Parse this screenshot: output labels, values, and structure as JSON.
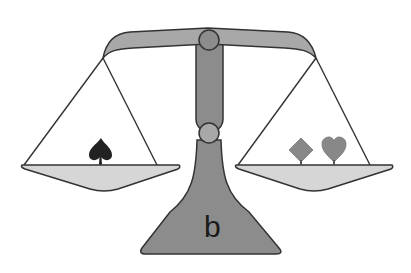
{
  "figure": {
    "base_label": "b",
    "left_pan": {
      "items": [
        "spade"
      ]
    },
    "right_pan": {
      "items": [
        "diamond",
        "heart"
      ]
    },
    "colors": {
      "structure": "#8c8c8c",
      "beam": "#a8a8a8",
      "pan_fill": "#d6d6d6",
      "outline": "#333333",
      "spade": "#222222",
      "diamond": "#888888",
      "heart": "#888888",
      "background": "#ffffff"
    }
  }
}
